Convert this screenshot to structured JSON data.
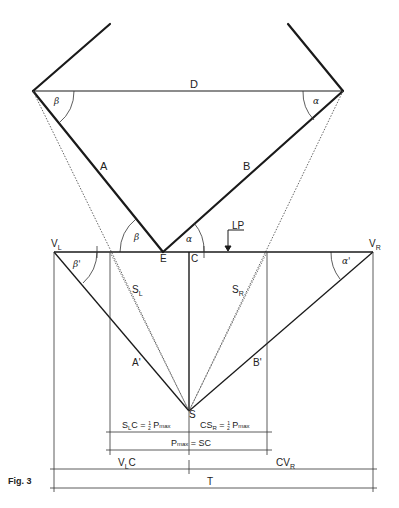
{
  "figure": {
    "caption": "Fig. 3",
    "colors": {
      "line": "#1a1a1a",
      "thin": "#333333",
      "dotted": "#555555",
      "background": "#ffffff"
    }
  },
  "labels": {
    "D": "D",
    "A": "A",
    "B": "B",
    "beta": "β",
    "alpha": "α",
    "beta_bottom": "β",
    "alpha_bottom": "α",
    "E": "E",
    "C": "C",
    "LP": "LP",
    "V_L": "V",
    "V_L_sub": "L",
    "V_R": "V",
    "V_R_sub": "R",
    "beta_prime": "β'",
    "alpha_prime": "α'",
    "S_L": "S",
    "S_L_sub": "L",
    "S_R": "S",
    "S_R_sub": "R",
    "A_prime": "A'",
    "B_prime": "B'",
    "S": "S",
    "eq_left": {
      "a": "S",
      "sub": "L",
      "b": "C = ",
      "frac_num": "1",
      "frac_den": "2",
      "c": " P",
      "max": "max"
    },
    "eq_right": {
      "a": "CS",
      "sub": "R",
      "b": " = ",
      "frac_num": "1",
      "frac_den": "2",
      "c": " P",
      "max": "max"
    },
    "eq_pmax": {
      "a": "P",
      "max": "max",
      "b": " = SC"
    },
    "VLC": {
      "a": "V",
      "sub": "L",
      "b": "C"
    },
    "CVR": {
      "a": "CV",
      "sub": "R"
    },
    "T": "T"
  }
}
